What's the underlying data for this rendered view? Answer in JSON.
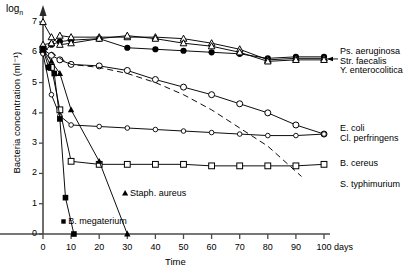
{
  "chart_data": {
    "type": "line",
    "title": "",
    "xlabel": "Time",
    "xunit": "days",
    "ylabel": "Bacteria concentration (ml⁻¹)",
    "y_prefix": "log",
    "y_prefix_sub": "n",
    "xlim": [
      0,
      100
    ],
    "ylim": [
      0,
      7
    ],
    "xticks": [
      0,
      10,
      20,
      30,
      40,
      50,
      60,
      70,
      80,
      90,
      100
    ],
    "yticks": [
      0,
      1,
      2,
      3,
      4,
      5,
      6,
      7
    ],
    "grid": false,
    "legend_position": "right-inline",
    "series": [
      {
        "name": "Ps. aeruginosa",
        "marker": "filled-circle",
        "line": "solid",
        "color": "#000000",
        "x": [
          0,
          3,
          6,
          10,
          20,
          30,
          40,
          50,
          60,
          70,
          80,
          90,
          100
        ],
        "y": [
          6.0,
          6.25,
          6.35,
          6.4,
          6.45,
          6.15,
          6.1,
          6.05,
          6.0,
          5.95,
          5.8,
          5.85,
          5.85
        ]
      },
      {
        "name": "Str. faecalis",
        "marker": "open-triangle",
        "line": "solid",
        "color": "#000000",
        "x": [
          0,
          3,
          6,
          10,
          20,
          30,
          40,
          50,
          60,
          70,
          80,
          90,
          100
        ],
        "y": [
          6.25,
          6.3,
          6.55,
          6.5,
          6.5,
          6.5,
          6.5,
          6.45,
          6.3,
          6.1,
          5.75,
          5.8,
          5.8
        ]
      },
      {
        "name": "Y. enterocolitica",
        "marker": "open-triangle",
        "line": "solid",
        "color": "#000000",
        "x": [
          0,
          3,
          6,
          10,
          20,
          30,
          40,
          50,
          60,
          70,
          80,
          90,
          100
        ],
        "y": [
          7.0,
          6.5,
          6.25,
          6.3,
          6.45,
          6.55,
          6.45,
          6.3,
          6.2,
          6.0,
          5.7,
          5.75,
          5.75
        ]
      },
      {
        "name": "E. coli",
        "marker": "open-circle",
        "line": "solid",
        "color": "#000000",
        "x": [
          0,
          3,
          6,
          10,
          20,
          30,
          40,
          50,
          60,
          70,
          80,
          90,
          100
        ],
        "y": [
          6.1,
          5.9,
          5.75,
          5.6,
          5.55,
          5.4,
          5.1,
          4.85,
          4.6,
          4.3,
          4.0,
          3.6,
          3.3
        ]
      },
      {
        "name": "Cl. perfringens",
        "marker": "open-circle-small",
        "line": "solid",
        "color": "#000000",
        "x": [
          0,
          3,
          6,
          10,
          20,
          30,
          40,
          50,
          60,
          70,
          80,
          90,
          100
        ],
        "y": [
          5.95,
          4.6,
          3.9,
          3.6,
          3.55,
          3.5,
          3.45,
          3.4,
          3.35,
          3.3,
          3.25,
          3.25,
          3.3
        ]
      },
      {
        "name": "B. cereus",
        "marker": "open-square",
        "line": "solid",
        "color": "#000000",
        "x": [
          0,
          3,
          6,
          10,
          20,
          30,
          40,
          50,
          60,
          70,
          80,
          90,
          100
        ],
        "y": [
          6.1,
          5.5,
          4.1,
          2.4,
          2.3,
          2.3,
          2.3,
          2.3,
          2.25,
          2.25,
          2.25,
          2.25,
          2.3
        ]
      },
      {
        "name": "S. typhimurium",
        "marker": "none",
        "line": "dashed",
        "color": "#000000",
        "x": [
          0,
          6,
          10,
          20,
          30,
          40,
          50,
          60,
          70,
          80,
          92
        ],
        "y": [
          6.2,
          5.8,
          5.6,
          5.5,
          5.3,
          5.0,
          4.6,
          4.1,
          3.5,
          2.9,
          1.9
        ]
      },
      {
        "name": "Staph. aureus",
        "marker": "filled-triangle",
        "line": "solid",
        "color": "#000000",
        "x": [
          0,
          3,
          6,
          10,
          20,
          30
        ],
        "y": [
          6.1,
          5.7,
          5.3,
          4.1,
          2.4,
          0.0
        ]
      },
      {
        "name": "B. megaterium",
        "marker": "filled-square",
        "line": "solid",
        "color": "#000000",
        "x": [
          0,
          2,
          4,
          6,
          8,
          11
        ],
        "y": [
          6.1,
          5.5,
          5.3,
          3.8,
          1.2,
          0.0
        ]
      }
    ],
    "right_labels": [
      {
        "text": "Ps. aeruginosa",
        "y": 6.05
      },
      {
        "text": "Str. faecalis",
        "y": 5.72
      },
      {
        "text": "Y. enterocolitica",
        "y": 5.4
      },
      {
        "text": "E. coli",
        "y": 3.5
      },
      {
        "text": "Cl. perfringens",
        "y": 3.18
      },
      {
        "text": "B. cereus",
        "y": 2.35
      },
      {
        "text": "S. typhimurium",
        "y": 1.65
      }
    ],
    "inline_labels": [
      {
        "text": "Staph. aureus",
        "x": 31,
        "y": 1.35
      },
      {
        "text": "B. megaterium",
        "x": 9,
        "y": 0.42
      }
    ]
  }
}
